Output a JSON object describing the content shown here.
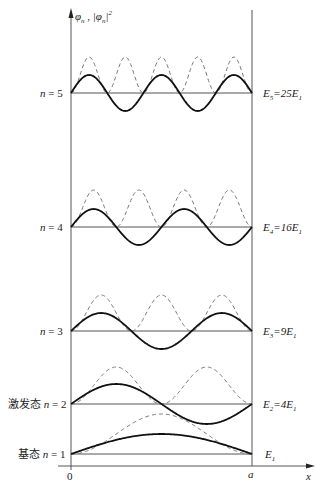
{
  "figure": {
    "y_axis_label": "φn , |φn|²",
    "x_axis_label": "x",
    "origin_label": "0",
    "wall_label": "a",
    "levels": [
      {
        "n": 1,
        "left_label": "基态 n = 1",
        "right_label": "E1"
      },
      {
        "n": 2,
        "left_label": "激发态 n = 2",
        "right_label": "E2=4E1"
      },
      {
        "n": 3,
        "left_label": "n = 3",
        "right_label": "E3=9E1"
      },
      {
        "n": 4,
        "left_label": "n = 4",
        "right_label": "E4=16E1"
      },
      {
        "n": 5,
        "left_label": "n = 5",
        "right_label": "E5=25E1"
      }
    ],
    "legend": {
      "solid": "wavefunction φn",
      "dashed": "probability density |φn|²"
    }
  },
  "chart_data": {
    "type": "line",
    "xlabel": "x",
    "ylabel": "φn, |φn|²",
    "x_range": [
      0,
      "a"
    ],
    "series": [
      {
        "n": 1,
        "energy": "E1",
        "wavefunction": "sin(πx/a)",
        "density": "sin²(πx/a)"
      },
      {
        "n": 2,
        "energy": "4E1",
        "wavefunction": "sin(2πx/a)",
        "density": "sin²(2πx/a)"
      },
      {
        "n": 3,
        "energy": "9E1",
        "wavefunction": "sin(3πx/a)",
        "density": "sin²(3πx/a)"
      },
      {
        "n": 4,
        "energy": "16E1",
        "wavefunction": "sin(4πx/a)",
        "density": "sin²(4πx/a)"
      },
      {
        "n": 5,
        "energy": "25E1",
        "wavefunction": "sin(5πx/a)",
        "density": "sin²(5πx/a)"
      }
    ]
  }
}
